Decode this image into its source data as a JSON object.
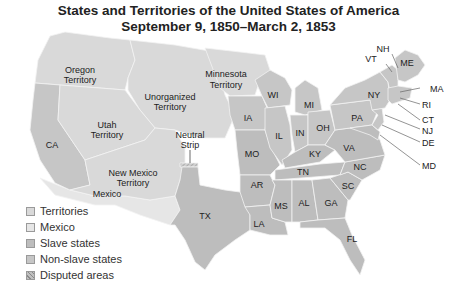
{
  "title": {
    "line1": "States and Territories of the United States of America",
    "line2": "September 9, 1850–March 2, 1853"
  },
  "colors": {
    "territories": "#d9d9d9",
    "mexico": "#e6e6e6",
    "slave_states": "#bdbdbd",
    "non_slave_states": "#c6c6c6",
    "disputed": "#c0c0c0",
    "borders": "#f2f2f2",
    "text": "#222222"
  },
  "map_labels": {
    "oregon": [
      "Oregon",
      "Territory"
    ],
    "utah": [
      "Utah",
      "Territory"
    ],
    "unorganized": [
      "Unorganized",
      "Territory"
    ],
    "minnesota": [
      "Minnesota",
      "Territory"
    ],
    "neutral_strip": [
      "Neutral",
      "Strip"
    ],
    "new_mexico": [
      "New Mexico",
      "Territory"
    ],
    "mexico": "Mexico",
    "states": {
      "CA": "CA",
      "TX": "TX",
      "WI": "WI",
      "MI": "MI",
      "IA": "IA",
      "IL": "IL",
      "IN": "IN",
      "OH": "OH",
      "MO": "MO",
      "KY": "KY",
      "PA": "PA",
      "NY": "NY",
      "VA": "VA",
      "NC": "NC",
      "TN": "TN",
      "AR": "AR",
      "SC": "SC",
      "MS": "MS",
      "AL": "AL",
      "GA": "GA",
      "LA": "LA",
      "FL": "FL",
      "VT": "VT",
      "NH": "NH",
      "ME": "ME",
      "MA": "MA",
      "RI": "RI",
      "CT": "CT",
      "NJ": "NJ",
      "DE": "DE",
      "MD": "MD"
    }
  },
  "legend": [
    {
      "key": "territories",
      "label": "Territories"
    },
    {
      "key": "mexico",
      "label": "Mexico"
    },
    {
      "key": "slave_states",
      "label": "Slave states"
    },
    {
      "key": "non_slave_states",
      "label": "Non-slave states"
    },
    {
      "key": "disputed",
      "label": "Disputed areas"
    }
  ]
}
